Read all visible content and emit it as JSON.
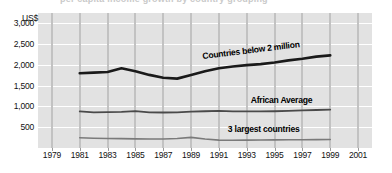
{
  "chart_data": {
    "type": "line",
    "title": "",
    "xlabel": "",
    "ylabel": "US$",
    "xlim": [
      1978,
      2002
    ],
    "ylim": [
      0,
      3250
    ],
    "grid": true,
    "legend_position": "inline-labels",
    "axis_unit": "US$",
    "x_ticks": [
      "1979",
      "1981",
      "1983",
      "1985",
      "1987",
      "1989",
      "1991",
      "1993",
      "1995",
      "1997",
      "1999",
      "2001"
    ],
    "y_ticks": [
      "3,000",
      "2,500",
      "2,000",
      "1,500",
      "1,000",
      "500"
    ],
    "y_tick_values": [
      3000,
      2500,
      2000,
      1500,
      1000,
      500
    ],
    "x": [
      1981,
      1982,
      1983,
      1984,
      1985,
      1986,
      1987,
      1988,
      1989,
      1990,
      1991,
      1992,
      1993,
      1994,
      1995,
      1996,
      1997,
      1998,
      1999
    ],
    "series": [
      {
        "name": "Countries below 2 million",
        "label": "Countries below 2 million",
        "color": "#1a1a1a",
        "values": [
          1800,
          1815,
          1830,
          1920,
          1850,
          1760,
          1690,
          1670,
          1760,
          1850,
          1920,
          1960,
          1995,
          2020,
          2060,
          2110,
          2150,
          2200,
          2230
        ]
      },
      {
        "name": "African Average",
        "label": "African Average",
        "color": "#4a4a4a",
        "values": [
          880,
          860,
          865,
          870,
          890,
          860,
          855,
          860,
          875,
          885,
          895,
          880,
          880,
          880,
          885,
          895,
          905,
          915,
          925
        ]
      },
      {
        "name": "3 largest countries",
        "label": "3 largest countries",
        "color": "#7a7a7a",
        "values": [
          245,
          235,
          230,
          225,
          220,
          218,
          215,
          230,
          255,
          215,
          190,
          188,
          190,
          192,
          195,
          198,
          200,
          202,
          205
        ]
      }
    ]
  },
  "style": {
    "plot_background": "#e2e2e2",
    "gridline_vertical": "#c2c2c2",
    "gridline_horizontal": "#ffffff",
    "page_background": "#ffffff"
  },
  "title_remnant": "per capita income growth by country grouping"
}
